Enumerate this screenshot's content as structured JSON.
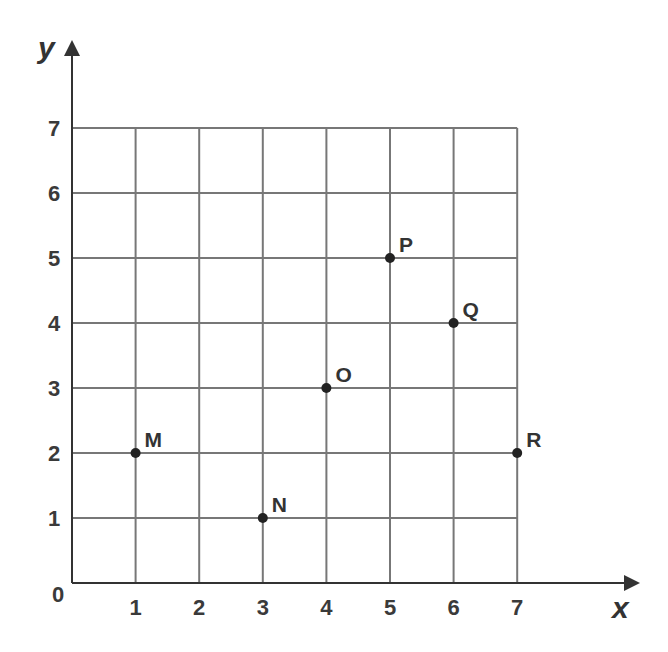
{
  "chart_data": {
    "type": "scatter",
    "title": "",
    "xlabel": "x",
    "ylabel": "y",
    "xlim": [
      0,
      7
    ],
    "ylim": [
      0,
      7
    ],
    "grid": true,
    "legend": null,
    "x_ticks": [
      "1",
      "2",
      "3",
      "4",
      "5",
      "6",
      "7"
    ],
    "y_ticks": [
      "1",
      "2",
      "3",
      "4",
      "5",
      "6",
      "7"
    ],
    "origin_label": "0",
    "points": [
      {
        "label": "M",
        "x": 1,
        "y": 2
      },
      {
        "label": "N",
        "x": 3,
        "y": 1
      },
      {
        "label": "O",
        "x": 4,
        "y": 3
      },
      {
        "label": "P",
        "x": 5,
        "y": 5
      },
      {
        "label": "Q",
        "x": 6,
        "y": 4
      },
      {
        "label": "R",
        "x": 7,
        "y": 2
      }
    ]
  },
  "colors": {
    "grid": "#777777",
    "axis": "#333333",
    "point": "#222222",
    "text": "#333333"
  }
}
